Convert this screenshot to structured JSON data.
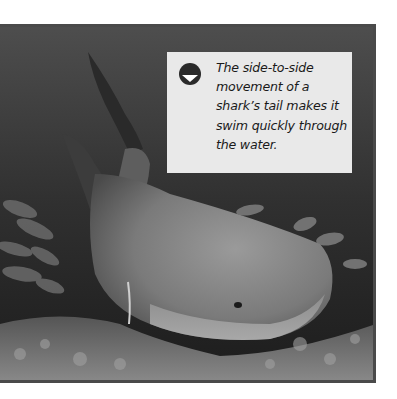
{
  "figure": {
    "caption": {
      "icon": "down-arrow-circle-icon",
      "text": "The side-to-side movement of a shark’s tail makes it swim quickly through the water."
    },
    "colors": {
      "caption_background": "#e9e9e9",
      "caption_text": "#1a1a1a",
      "icon_fill": "#2a2a2a",
      "photo_frame": "#4a4a4a",
      "page_background": "#ffffff"
    }
  }
}
